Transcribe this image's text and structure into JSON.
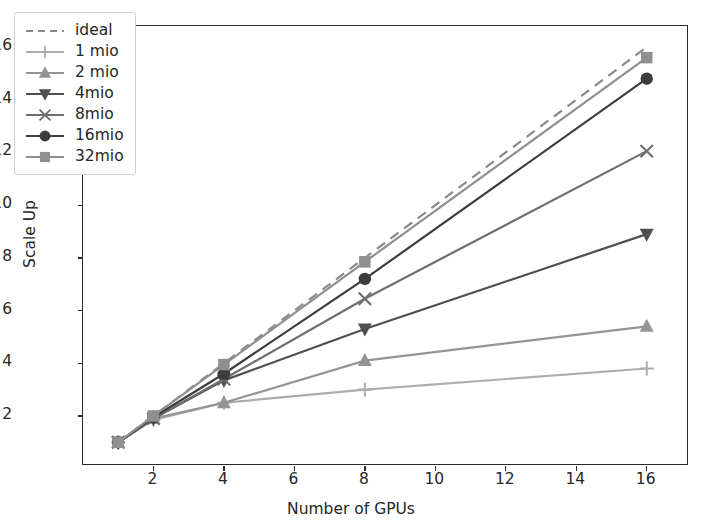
{
  "chart_data": {
    "type": "line",
    "title": "",
    "xlabel": "Number of GPUs",
    "ylabel": "Scale Up",
    "x": [
      1,
      2,
      4,
      8,
      16
    ],
    "xlim": [
      0,
      17.2
    ],
    "ylim": [
      0.1,
      16.8
    ],
    "xticks": [
      2,
      4,
      6,
      8,
      10,
      12,
      14,
      16
    ],
    "yticks": [
      2,
      4,
      6,
      8,
      10,
      12,
      14,
      16
    ],
    "xticklabels": [
      "2",
      "4",
      "6",
      "8",
      "10",
      "12",
      "14",
      "16"
    ],
    "yticklabels": [
      "2",
      "4",
      "6",
      "8",
      "10",
      "12",
      "14",
      "16"
    ],
    "grid": false,
    "legend_position": "upper left",
    "series": [
      {
        "name": "ideal",
        "values": [
          1,
          2,
          4,
          8,
          16
        ],
        "color": "#8a8a8a",
        "marker": "none",
        "dash": true,
        "width": 2.2
      },
      {
        "name": "1 mio",
        "values": [
          1,
          1.85,
          2.5,
          3.0,
          3.8
        ],
        "color": "#adadad",
        "marker": "plus",
        "dash": false,
        "width": 2.2
      },
      {
        "name": "2 mio",
        "values": [
          1,
          1.9,
          2.5,
          4.1,
          5.4
        ],
        "color": "#949494",
        "marker": "triangle-up",
        "dash": false,
        "width": 2.2
      },
      {
        "name": "4mio",
        "values": [
          1,
          1.9,
          3.35,
          5.3,
          8.9
        ],
        "color": "#4f4f4f",
        "marker": "triangle-down",
        "dash": false,
        "width": 2.2
      },
      {
        "name": "8mio",
        "values": [
          1,
          1.9,
          3.4,
          6.45,
          12.05
        ],
        "color": "#6e6e6e",
        "marker": "x",
        "dash": false,
        "width": 2.2
      },
      {
        "name": "16mio",
        "values": [
          1,
          1.95,
          3.6,
          7.2,
          14.8
        ],
        "color": "#3d3d3d",
        "marker": "circle",
        "dash": false,
        "width": 2.2
      },
      {
        "name": "32mio",
        "values": [
          1,
          2.0,
          3.95,
          7.85,
          15.6
        ],
        "color": "#8f8f8f",
        "marker": "square",
        "dash": false,
        "width": 2.2
      }
    ]
  }
}
